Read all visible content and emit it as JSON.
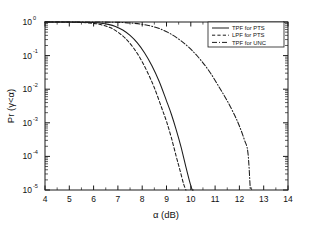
{
  "chart_data": {
    "type": "line",
    "title": "",
    "xlabel": "α (dB)",
    "ylabel": "Pr (γ<α)",
    "xlim": [
      4,
      14
    ],
    "ylim": [
      1e-05,
      1
    ],
    "yscale": "log",
    "grid": false,
    "legend_position": "top-right",
    "xticks": [
      "4",
      "5",
      "6",
      "7",
      "8",
      "9",
      "10",
      "11",
      "12",
      "13",
      "14"
    ],
    "yticks": [
      {
        "base": "10",
        "exp": "0"
      },
      {
        "base": "10",
        "exp": "-1"
      },
      {
        "base": "10",
        "exp": "-2"
      },
      {
        "base": "10",
        "exp": "-3"
      },
      {
        "base": "10",
        "exp": "-4"
      },
      {
        "base": "10",
        "exp": "-5"
      }
    ],
    "series": [
      {
        "name": "TPF for PTS",
        "style": "solid",
        "x": [
          4.0,
          5.0,
          5.5,
          6.0,
          6.3,
          6.6,
          6.9,
          7.2,
          7.5,
          7.8,
          8.1,
          8.4,
          8.7,
          9.0,
          9.2,
          9.4,
          9.6,
          9.8,
          9.95,
          10.05,
          10.1
        ],
        "y": [
          1.0,
          0.995,
          0.985,
          0.96,
          0.92,
          0.85,
          0.74,
          0.58,
          0.4,
          0.24,
          0.12,
          0.05,
          0.017,
          0.0045,
          0.0018,
          0.00062,
          0.00019,
          4.8e-05,
          1.8e-05,
          1.05e-05,
          1e-05
        ]
      },
      {
        "name": "LPF for PTS",
        "style": "dashed",
        "x": [
          4.0,
          5.0,
          5.4,
          5.8,
          6.1,
          6.4,
          6.7,
          7.0,
          7.3,
          7.6,
          7.9,
          8.2,
          8.5,
          8.8,
          9.0,
          9.2,
          9.4,
          9.55,
          9.7,
          9.8
        ],
        "y": [
          1.0,
          0.99,
          0.975,
          0.94,
          0.89,
          0.8,
          0.67,
          0.5,
          0.33,
          0.185,
          0.088,
          0.034,
          0.011,
          0.0028,
          0.0011,
          0.00036,
          0.0001,
          4e-05,
          1.55e-05,
          1e-05
        ]
      },
      {
        "name": "TPF for UNC",
        "style": "dashdot",
        "x": [
          4.0,
          5.5,
          6.2,
          6.8,
          7.2,
          7.6,
          8.0,
          8.4,
          8.8,
          9.2,
          9.6,
          10.0,
          10.4,
          10.8,
          11.2,
          11.5,
          11.8,
          12.0,
          12.2,
          12.35,
          12.45
        ],
        "y": [
          1.0,
          0.999,
          0.996,
          0.985,
          0.965,
          0.925,
          0.855,
          0.745,
          0.6,
          0.43,
          0.275,
          0.155,
          0.075,
          0.031,
          0.0105,
          0.0045,
          0.0017,
          0.0008,
          0.00032,
          0.00013,
          1e-05
        ]
      }
    ]
  },
  "legend": {
    "items": [
      {
        "label": "TPF for PTS",
        "style": "solid"
      },
      {
        "label": "LPF for PTS",
        "style": "dashed"
      },
      {
        "label": "TPF for UNC",
        "style": "dashdot"
      }
    ]
  }
}
